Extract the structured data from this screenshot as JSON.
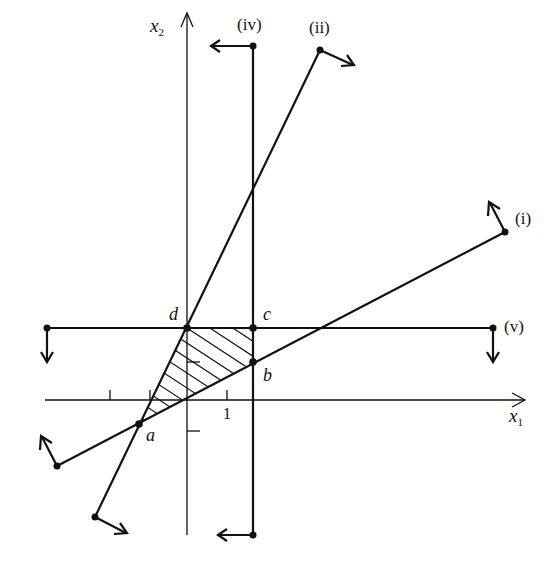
{
  "diagram": {
    "type": "linear-programming feasible region",
    "axes": {
      "x_label": "x",
      "x_sub": "1",
      "y_label": "x",
      "y_sub": "2",
      "tick_label": "1"
    },
    "constraints": [
      {
        "id": "i",
        "label": "(i)"
      },
      {
        "id": "ii",
        "label": "(ii)"
      },
      {
        "id": "iv",
        "label": "(iv)"
      },
      {
        "id": "v",
        "label": "(v)"
      }
    ],
    "vertices": [
      {
        "id": "a",
        "label": "a"
      },
      {
        "id": "b",
        "label": "b"
      },
      {
        "id": "c",
        "label": "c"
      },
      {
        "id": "d",
        "label": "d"
      }
    ],
    "region": "hatched quadrilateral a-b-c-d",
    "colors": {
      "ink": "#111111",
      "background": "#ffffff"
    }
  }
}
